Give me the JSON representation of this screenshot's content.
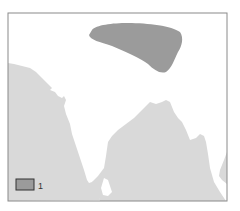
{
  "map": {
    "colors": {
      "land": "#ffffff",
      "sea": "#d9d9d9",
      "region_1": "#9b9b9b",
      "frame": "#8a8a8a"
    },
    "regions": [
      {
        "id": "1",
        "description": "shaded region north of subcontinent"
      }
    ],
    "legend": {
      "items": [
        {
          "swatch_color": "#9b9b9b",
          "label": "1"
        }
      ]
    }
  }
}
